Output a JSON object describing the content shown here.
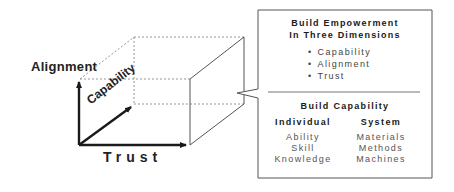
{
  "diagram": {
    "axes": {
      "vertical_label": "Alignment",
      "depth_label": "Capability",
      "horizontal_label": "Trust"
    },
    "callout": {
      "title_line1": "Build Empowerment",
      "title_line2": "In Three Dimensions",
      "bullets": [
        "Capability",
        "Alignment",
        "Trust"
      ],
      "section2_title": "Build Capability",
      "columns": [
        {
          "heading": "Individual",
          "items": [
            "Ability",
            "Skill",
            "Knowledge"
          ]
        },
        {
          "heading": "System",
          "items": [
            "Materials",
            "Methods",
            "Machines"
          ]
        }
      ]
    },
    "colors": {
      "line": "#555555",
      "arrow": "#1a1a1a",
      "dashed": "#888888",
      "background": "#ffffff"
    }
  }
}
